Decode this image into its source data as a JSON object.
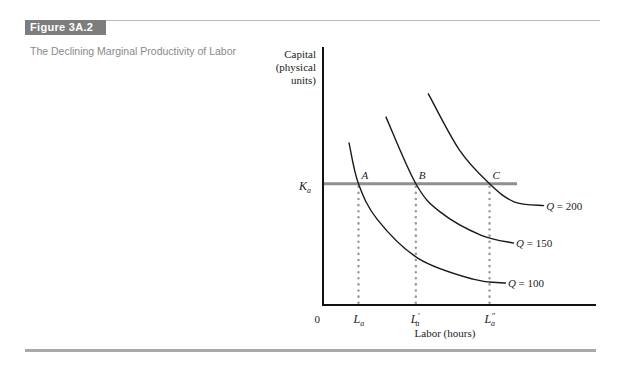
{
  "figure": {
    "label": "Figure 3A.2",
    "title": "The Declining Marginal Productivity of Labor"
  },
  "chart_data": {
    "type": "line",
    "title": "The Declining Marginal Productivity of Labor",
    "xlabel": "Labor (hours)",
    "ylabel_lines": [
      "Capital",
      "(physical",
      "units)"
    ],
    "origin_label": "0",
    "x_ticks": [
      {
        "base": "L",
        "sub": "a",
        "prime": ""
      },
      {
        "base": "L",
        "sub": "a",
        "prime": "′"
      },
      {
        "base": "L",
        "sub": "a",
        "prime": "″"
      }
    ],
    "y_tick": {
      "base": "K",
      "sub": "a"
    },
    "xlim": [
      0,
      100
    ],
    "ylim": [
      0,
      100
    ],
    "capital_level": 47,
    "labor_levels": [
      13,
      34,
      61
    ],
    "points": [
      {
        "label": "A",
        "x": 13,
        "y": 47
      },
      {
        "label": "B",
        "x": 34,
        "y": 47
      },
      {
        "label": "C",
        "x": 61,
        "y": 47
      }
    ],
    "series": [
      {
        "name": "Q = 100",
        "q": "Q",
        "value": "100",
        "points": [
          [
            9.5,
            63
          ],
          [
            13,
            47
          ],
          [
            20,
            33
          ],
          [
            35,
            18
          ],
          [
            55,
            10
          ],
          [
            67,
            8.5
          ]
        ]
      },
      {
        "name": "Q = 150",
        "q": "Q",
        "value": "150",
        "points": [
          [
            23,
            73
          ],
          [
            34,
            47
          ],
          [
            43,
            36
          ],
          [
            58,
            27
          ],
          [
            70,
            24
          ]
        ]
      },
      {
        "name": "Q = 200",
        "q": "Q",
        "value": "200",
        "points": [
          [
            38.5,
            82
          ],
          [
            50,
            60
          ],
          [
            61,
            47
          ],
          [
            70,
            40
          ],
          [
            81,
            38.5
          ]
        ]
      }
    ],
    "grid": false,
    "legend": "none"
  }
}
